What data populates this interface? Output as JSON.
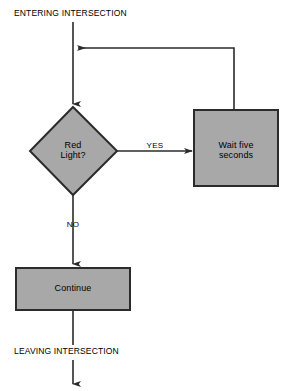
{
  "diagram": {
    "type": "flowchart",
    "title_visible": false,
    "background_color": "#ffffff",
    "shape_fill_color": "#a8a8a8",
    "shape_border_color": "#2b2b2b",
    "line_color": "#2b2b2b",
    "text_color": "#000000",
    "terminals": {
      "start_label": "ENTERING INTERSECTION",
      "end_label": "LEAVING INTERSECTION"
    },
    "nodes": [
      {
        "id": "decision-red-light",
        "shape": "diamond",
        "label": "Red\nLight?"
      },
      {
        "id": "process-wait",
        "shape": "rectangle",
        "label": "Wait five\nseconds"
      },
      {
        "id": "process-continue",
        "shape": "rectangle",
        "label": "Continue"
      }
    ],
    "edge_labels": {
      "yes": "YES",
      "no": "NO"
    }
  }
}
